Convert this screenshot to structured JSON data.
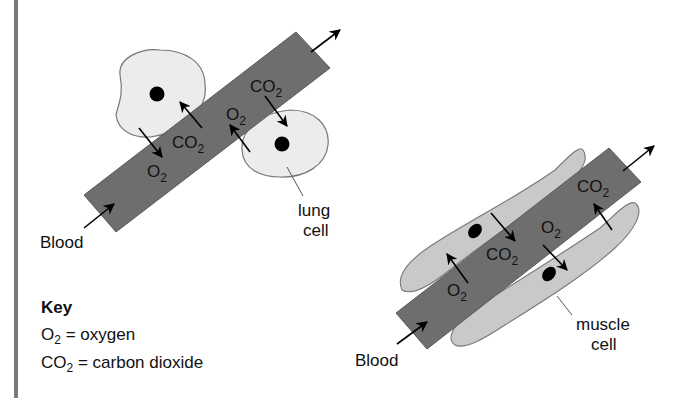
{
  "colors": {
    "vessel_fill": "#6e6e6e",
    "vessel_stroke": "#555555",
    "lung_cell_fill": "#ececec",
    "muscle_cell_fill": "#c9c9c9",
    "cell_stroke": "#777777",
    "nucleus": "#000000",
    "arrow": "#000000",
    "left_rule": "#7a7a7a"
  },
  "lung_diagram": {
    "blood_label": "Blood",
    "cell_label_line1": "lung",
    "cell_label_line2": "cell",
    "gas_labels": [
      {
        "id": "o2-left",
        "base": "O",
        "sub": "2"
      },
      {
        "id": "co2-left",
        "base": "CO",
        "sub": "2"
      },
      {
        "id": "o2-right",
        "base": "O",
        "sub": "2"
      },
      {
        "id": "co2-right",
        "base": "CO",
        "sub": "2"
      }
    ]
  },
  "muscle_diagram": {
    "blood_label": "Blood",
    "cell_label_line1": "muscle",
    "cell_label_line2": "cell",
    "gas_labels": [
      {
        "id": "o2-left",
        "base": "O",
        "sub": "2"
      },
      {
        "id": "co2-mid",
        "base": "CO",
        "sub": "2"
      },
      {
        "id": "o2-mid",
        "base": "O",
        "sub": "2"
      },
      {
        "id": "co2-right",
        "base": "CO",
        "sub": "2"
      }
    ]
  },
  "key": {
    "title": "Key",
    "items": [
      {
        "symbol_base": "O",
        "symbol_sub": "2",
        "meaning": " = oxygen"
      },
      {
        "symbol_base": "CO",
        "symbol_sub": "2",
        "meaning": " = carbon dioxide"
      }
    ]
  }
}
